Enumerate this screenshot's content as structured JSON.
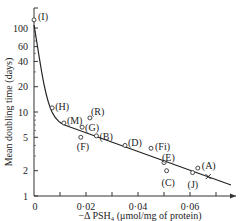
{
  "chart_data": {
    "type": "scatter",
    "title": "",
    "xlabel": "−Δ PSH₄ (μmol/mg of protein)",
    "ylabel": "Mean doubling time (days)",
    "x_ticks": [
      "0",
      "0·02",
      "0·04",
      "0·06"
    ],
    "x_tick_values": [
      0,
      0.02,
      0.04,
      0.06
    ],
    "y_ticks": [
      "1",
      "2",
      "5",
      "10",
      "20",
      "40",
      "60",
      "100"
    ],
    "y_tick_values": [
      1,
      2,
      5,
      10,
      20,
      40,
      60,
      100
    ],
    "yscale": "log",
    "xlim": [
      0,
      0.075
    ],
    "ylim": [
      1,
      150
    ],
    "grid": false,
    "legend": "none",
    "points": [
      {
        "label": "(I)",
        "x": 0.0,
        "y": 125
      },
      {
        "label": "(H)",
        "x": 0.007,
        "y": 11.2
      },
      {
        "label": "(M)",
        "x": 0.0115,
        "y": 7.4
      },
      {
        "label": "(R)",
        "x": 0.0215,
        "y": 8.5
      },
      {
        "label": "(G)",
        "x": 0.0185,
        "y": 6.6
      },
      {
        "label": "(F)",
        "x": 0.018,
        "y": 5.0
      },
      {
        "label": "(B)",
        "x": 0.024,
        "y": 5.2
      },
      {
        "label": "(D)",
        "x": 0.035,
        "y": 4.0
      },
      {
        "label": "(Fi)",
        "x": 0.045,
        "y": 3.7
      },
      {
        "label": "(E)",
        "x": 0.05,
        "y": 2.5
      },
      {
        "label": "(C)",
        "x": 0.051,
        "y": 2.0
      },
      {
        "label": "(J)",
        "x": 0.061,
        "y": 1.9
      },
      {
        "label": "(A)",
        "x": 0.063,
        "y": 2.15
      },
      {
        "label": "",
        "x": 0.067,
        "y": 1.7,
        "marker": "x"
      }
    ],
    "fit_curve": "steep decline from ~100 at x=0 to ~7 at x≈0.012, then linear (log-scale) decline to ~1.35 at x≈0.076"
  }
}
